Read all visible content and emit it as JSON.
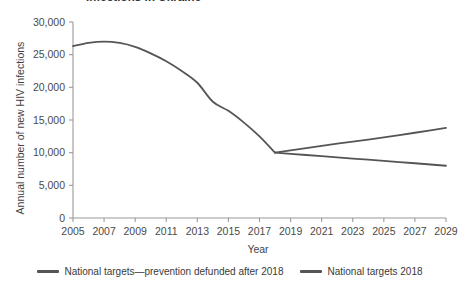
{
  "chart_data": {
    "type": "line",
    "title": "Infections in Ukraine",
    "xlabel": "Year",
    "ylabel": "Annual number of new HIV infections",
    "xlim": [
      2005,
      2029
    ],
    "ylim": [
      0,
      30000
    ],
    "grid": false,
    "legend_position": "bottom",
    "x_ticks": [
      "2005",
      "2007",
      "2009",
      "2011",
      "2013",
      "2015",
      "2017",
      "2019",
      "2021",
      "2023",
      "2025",
      "2027",
      "2029"
    ],
    "x_tick_values": [
      2005,
      2007,
      2009,
      2011,
      2013,
      2015,
      2017,
      2019,
      2021,
      2023,
      2025,
      2027,
      2029
    ],
    "y_ticks": [
      "0",
      "5,000",
      "10,000",
      "15,000",
      "20,000",
      "25,000",
      "30,000"
    ],
    "y_tick_values": [
      0,
      5000,
      10000,
      15000,
      20000,
      25000,
      30000
    ],
    "x": [
      2005,
      2006,
      2007,
      2008,
      2009,
      2010,
      2011,
      2012,
      2013,
      2014,
      2015,
      2016,
      2017,
      2018,
      2019,
      2020,
      2021,
      2022,
      2023,
      2024,
      2025,
      2026,
      2027,
      2028,
      2029
    ],
    "series": [
      {
        "name": "National targets—prevention defunded after 2018",
        "color": "#555555",
        "values": [
          26300,
          26800,
          27000,
          26800,
          26200,
          25200,
          24000,
          22500,
          20700,
          17800,
          16400,
          14600,
          12500,
          10000,
          10350,
          10700,
          11050,
          11400,
          11700,
          12000,
          12350,
          12700,
          13050,
          13400,
          13800
        ]
      },
      {
        "name": "National targets 2018",
        "color": "#555555",
        "values": [
          26300,
          26800,
          27000,
          26800,
          26200,
          25200,
          24000,
          22500,
          20700,
          17800,
          16400,
          14600,
          12500,
          10000,
          9820,
          9640,
          9460,
          9280,
          9100,
          8920,
          8740,
          8560,
          8380,
          8190,
          8000
        ]
      }
    ]
  },
  "legend": {
    "items": [
      {
        "label": "National targets—prevention defunded after 2018"
      },
      {
        "label": "National targets 2018"
      }
    ]
  },
  "colors": {
    "line": "#555555",
    "axis": "#9a9a9a",
    "text": "#3a3a3a"
  }
}
